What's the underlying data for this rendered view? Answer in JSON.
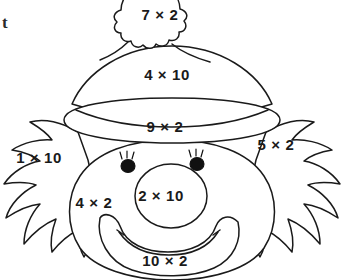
{
  "page": {
    "background_color": "#ffffff",
    "line_color": "#1a1a1a",
    "text_color": "#1a1a1a"
  },
  "corner_mark": {
    "text": "t"
  },
  "problems": [
    {
      "id": "pompom",
      "region": "hat-pompom",
      "label": "7 × 2",
      "factor_a": 7,
      "factor_b": 2,
      "product": 14
    },
    {
      "id": "hat-dome",
      "region": "hat-crown",
      "label": "4 × 10",
      "factor_a": 4,
      "factor_b": 10,
      "product": 40
    },
    {
      "id": "hat-brim",
      "region": "hat-brim",
      "label": "9 × 2",
      "factor_a": 9,
      "factor_b": 2,
      "product": 18
    },
    {
      "id": "hair-left",
      "region": "left-hair",
      "label": "1 × 10",
      "factor_a": 1,
      "factor_b": 10,
      "product": 10
    },
    {
      "id": "hair-right",
      "region": "right-hair",
      "label": "5 × 2",
      "factor_a": 5,
      "factor_b": 2,
      "product": 10
    },
    {
      "id": "cheek-left",
      "region": "left-cheek",
      "label": "4 × 2",
      "factor_a": 4,
      "factor_b": 2,
      "product": 8
    },
    {
      "id": "nose",
      "region": "nose",
      "label": "2 × 10",
      "factor_a": 2,
      "factor_b": 10,
      "product": 20
    },
    {
      "id": "mouth",
      "region": "mouth",
      "label": "10 × 2",
      "factor_a": 10,
      "factor_b": 2,
      "product": 20
    }
  ]
}
